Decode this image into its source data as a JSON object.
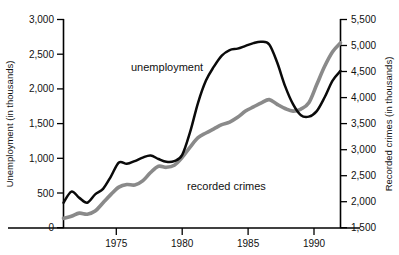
{
  "chart_data": {
    "type": "line",
    "title": "",
    "xlabel": "",
    "grid": false,
    "legend_position": "inline-annotations",
    "xlim": [
      1971,
      1992
    ],
    "x_ticks": [
      1975,
      1980,
      1985,
      1990
    ],
    "x_tick_labels": [
      "1975",
      "1980",
      "1985",
      "1990"
    ],
    "axes": [
      {
        "side": "left",
        "label": "Unemployment (in thousands)",
        "ylim": [
          0,
          3000
        ],
        "ticks": [
          0,
          500,
          1000,
          1500,
          2000,
          2500,
          3000
        ],
        "tick_labels": [
          "0",
          "500",
          "1,000",
          "1,500",
          "2,000",
          "2,500",
          "3,000"
        ]
      },
      {
        "side": "right",
        "label": "Recorded crimes (in thousands)",
        "ylim": [
          1500,
          5500
        ],
        "ticks": [
          1500,
          2000,
          2500,
          3000,
          3500,
          4000,
          4500,
          5000,
          5500
        ],
        "tick_labels": [
          "1,500",
          "2,000",
          "2,500",
          "3,000",
          "3,500",
          "4,000",
          "4,500",
          "5,000",
          "5,500"
        ]
      }
    ],
    "series": [
      {
        "name": "unemployment",
        "annotation": "unemployment",
        "axis": "left",
        "color": "#0a0a0a",
        "unit": "thousands",
        "x": [
          1971,
          1971.6,
          1972.2,
          1972.8,
          1973.4,
          1974,
          1974.6,
          1975.2,
          1975.8,
          1976.4,
          1977,
          1977.6,
          1978.2,
          1978.8,
          1979.4,
          1980,
          1980.6,
          1981.2,
          1981.8,
          1982.4,
          1983,
          1983.6,
          1984.2,
          1984.8,
          1985.4,
          1986,
          1986.6,
          1987.2,
          1987.8,
          1988.4,
          1989,
          1989.6,
          1990.2,
          1990.8,
          1991.4,
          1992
        ],
        "values": [
          360,
          520,
          430,
          360,
          480,
          560,
          740,
          940,
          920,
          960,
          1010,
          1040,
          990,
          950,
          960,
          1050,
          1380,
          1800,
          2120,
          2320,
          2480,
          2560,
          2580,
          2620,
          2660,
          2680,
          2640,
          2380,
          2040,
          1780,
          1620,
          1600,
          1680,
          1880,
          2120,
          2260
        ]
      },
      {
        "name": "recorded crimes",
        "annotation": "recorded crimes",
        "axis": "right",
        "color": "#8a8a8a",
        "unit": "thousands",
        "x": [
          1971,
          1971.6,
          1972.2,
          1972.8,
          1973.4,
          1974,
          1974.6,
          1975.2,
          1975.8,
          1976.4,
          1977,
          1977.6,
          1978.2,
          1978.8,
          1979.4,
          1980,
          1980.6,
          1981.2,
          1981.8,
          1982.4,
          1983,
          1983.6,
          1984.2,
          1984.8,
          1985.4,
          1986,
          1986.6,
          1987.2,
          1987.8,
          1988.4,
          1989,
          1989.6,
          1990.2,
          1990.8,
          1991.4,
          1992
        ],
        "values": [
          1680,
          1720,
          1780,
          1760,
          1820,
          1980,
          2140,
          2280,
          2330,
          2320,
          2400,
          2560,
          2680,
          2660,
          2700,
          2850,
          3050,
          3230,
          3320,
          3400,
          3480,
          3530,
          3620,
          3740,
          3820,
          3900,
          3960,
          3870,
          3790,
          3740,
          3780,
          3900,
          4250,
          4600,
          4880,
          5050
        ]
      }
    ]
  }
}
